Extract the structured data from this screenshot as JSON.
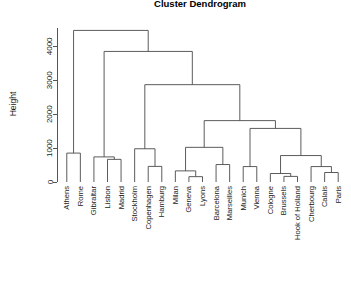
{
  "plot": {
    "title": "Cluster Dendrogram",
    "ylabel": "Height",
    "xlabel": ""
  },
  "axis": {
    "ticks": [
      0,
      1000,
      2000,
      3000,
      4000
    ],
    "tick_labels": [
      "0",
      "1000",
      "2000",
      "3000",
      "4000"
    ],
    "ymin": 0,
    "ymax": 4600
  },
  "chart_data": {
    "type": "dendrogram",
    "title": "Cluster Dendrogram",
    "xlabel": "",
    "ylabel": "Height",
    "ylim": [
      0,
      4600
    ],
    "grid": false,
    "legend": null,
    "method": "complete",
    "leaves": [
      "Athens",
      "Rome",
      "Gibraltar",
      "Lisbon",
      "Madrid",
      "Stockholm",
      "Copenhagen",
      "Hamburg",
      "Milan",
      "Geneva",
      "Lyons",
      "Barcelona",
      "Marseilles",
      "Munich",
      "Vienna",
      "Cologne",
      "Brussels",
      "Hook of Holland",
      "Cherbourg",
      "Calais",
      "Paris"
    ],
    "merges": [
      {
        "id": "m1",
        "left": "Lisbon",
        "right": "Madrid",
        "height": 668
      },
      {
        "id": "m2",
        "left": "Gibraltar",
        "right": "m1",
        "height": 740
      },
      {
        "id": "m3",
        "left": "Athens",
        "right": "Rome",
        "height": 852
      },
      {
        "id": "m4",
        "left": "Copenhagen",
        "right": "Hamburg",
        "height": 460
      },
      {
        "id": "m5",
        "left": "Stockholm",
        "right": "m4",
        "height": 980
      },
      {
        "id": "m6",
        "left": "Geneva",
        "right": "Lyons",
        "height": 158
      },
      {
        "id": "m7",
        "left": "Milan",
        "right": "m6",
        "height": 328
      },
      {
        "id": "m8",
        "left": "Barcelona",
        "right": "Marseilles",
        "height": 515
      },
      {
        "id": "m9",
        "left": "m7",
        "right": "m8",
        "height": 1022
      },
      {
        "id": "m10",
        "left": "Munich",
        "right": "Vienna",
        "height": 455
      },
      {
        "id": "m11",
        "left": "Brussels",
        "right": "Hook of Holland",
        "height": 165
      },
      {
        "id": "m12",
        "left": "Cologne",
        "right": "m11",
        "height": 250
      },
      {
        "id": "m13",
        "left": "Calais",
        "right": "Paris",
        "height": 280
      },
      {
        "id": "m14",
        "left": "Cherbourg",
        "right": "m13",
        "height": 455
      },
      {
        "id": "m15",
        "left": "m12",
        "right": "m14",
        "height": 780
      },
      {
        "id": "m16",
        "left": "m10",
        "right": "m15",
        "height": 1580
      },
      {
        "id": "m17",
        "left": "m9",
        "right": "m16",
        "height": 1810
      },
      {
        "id": "m18",
        "left": "m5",
        "right": "m17",
        "height": 2870
      },
      {
        "id": "m19",
        "left": "m2",
        "right": "m18",
        "height": 3850
      },
      {
        "id": "m20",
        "left": "m3",
        "right": "m19",
        "height": 4470
      }
    ]
  },
  "geometry": {
    "plot_left": 60,
    "plot_right": 345,
    "axis_x": 57,
    "axis_top": 26,
    "baseline_y": 182,
    "label_gap": 4,
    "title_x": 200,
    "title_y": 7
  }
}
